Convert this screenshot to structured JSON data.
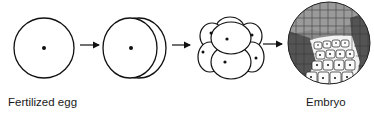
{
  "diagram": {
    "type": "embryonic development sequence",
    "stages": [
      {
        "name": "fertilized-egg",
        "description": "single cell with nucleus"
      },
      {
        "name": "two-cell",
        "description": "first cleavage, two cells"
      },
      {
        "name": "eight-cell",
        "description": "cleavage stage, multiple cells with nuclei"
      },
      {
        "name": "embryo",
        "description": "many-celled sphere with shaded regions"
      }
    ],
    "labels": {
      "start": "Fertilized egg",
      "end": "Embryo"
    },
    "colors": {
      "stroke": "#111111",
      "dark_region": "#555555",
      "mid_region": "#8a8a8a",
      "light_region": "#f2f2f2"
    }
  }
}
